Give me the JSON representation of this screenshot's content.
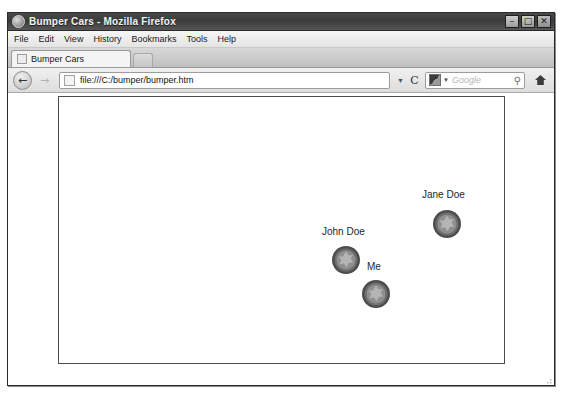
{
  "window": {
    "title": "Bumper Cars - Mozilla Firefox",
    "icon": "firefox-icon",
    "controls": {
      "minimize": "–",
      "maximize": "□",
      "close": "✕"
    }
  },
  "menubar": {
    "items": [
      {
        "label": "File",
        "accel": "F"
      },
      {
        "label": "Edit",
        "accel": "E"
      },
      {
        "label": "View",
        "accel": "V"
      },
      {
        "label": "History",
        "accel": "s"
      },
      {
        "label": "Bookmarks",
        "accel": "B"
      },
      {
        "label": "Tools",
        "accel": "T"
      },
      {
        "label": "Help",
        "accel": "H"
      }
    ]
  },
  "tabs": {
    "active": "Bumper Cars",
    "new_tab_label": ""
  },
  "navbar": {
    "back_glyph": "←",
    "forward_glyph": "→",
    "url": "file:///C:/bumper/bumper.htm",
    "url_dropdown_glyph": "▼",
    "reload_glyph": "C",
    "search_placeholder": "Google",
    "search_caret_glyph": "▼",
    "search_magnifier_glyph": "⚲",
    "home_glyph": "⌂"
  },
  "page": {
    "title": "Bumper Cars",
    "cars": [
      {
        "name": "Jane Doe",
        "label_x": 363,
        "label_y": 92,
        "car_x": 373,
        "car_y": 112
      },
      {
        "name": "John Doe",
        "label_x": 263,
        "label_y": 129,
        "car_x": 272,
        "car_y": 148
      },
      {
        "name": "Me",
        "label_x": 308,
        "label_y": 164,
        "car_x": 302,
        "car_y": 182
      }
    ]
  },
  "colors": {
    "car_ring": "#4d4d4d",
    "car_body": "#8f8f8f",
    "car_figure": "#b5b5b5",
    "playfield_border": "#4c4c4c",
    "text": "#262626"
  }
}
